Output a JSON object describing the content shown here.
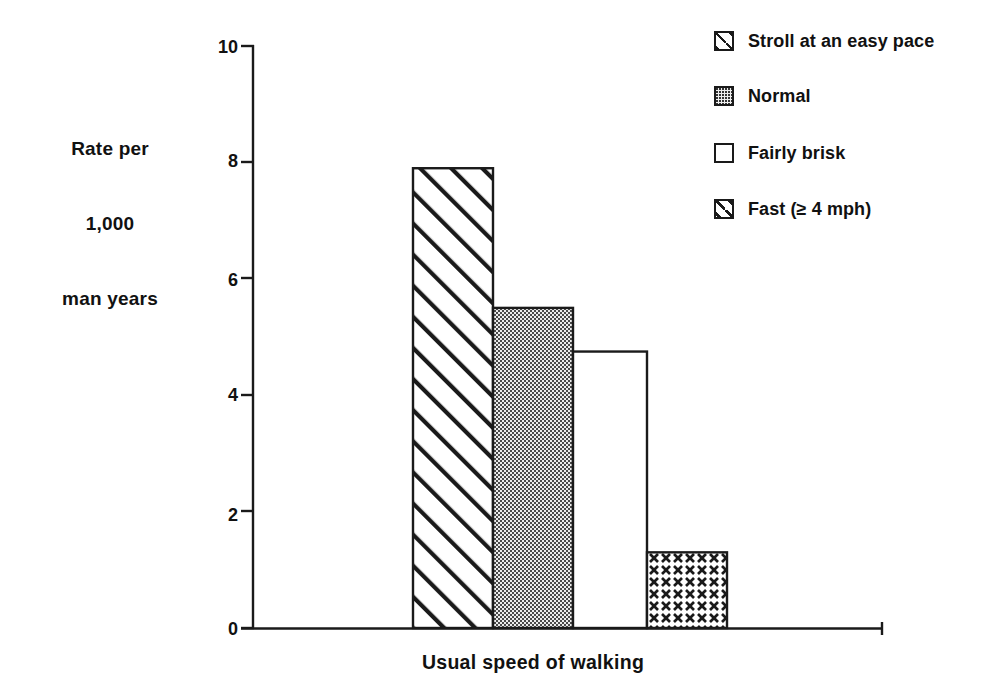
{
  "chart_data": {
    "type": "bar",
    "title": "",
    "subtitle": "",
    "xlabel": "Usual speed of walking",
    "ylabel": "Rate per\n1,000\nman years",
    "ylabel_lines": [
      "Rate per",
      "1,000",
      "man years"
    ],
    "categories": [
      "Stroll at an easy pace",
      "Normal",
      "Fairly brisk",
      "Fast (≥ 4 mph)"
    ],
    "values": [
      7.9,
      5.5,
      4.75,
      1.3
    ],
    "ylim": [
      0,
      10
    ],
    "yticks": [
      0,
      2,
      4,
      6,
      8,
      10
    ],
    "ytick_labels": [
      "0",
      "2",
      "4",
      "6",
      "8",
      "10"
    ],
    "xticks": [],
    "xtick_labels": [],
    "grid": false,
    "legend_position": "top-right",
    "bars_adjacent": true,
    "series": [
      {
        "name": "Rate per 1,000 man years",
        "values": [
          7.9,
          5.5,
          4.75,
          1.3
        ]
      }
    ],
    "bar_styles": [
      "diagonal-hatch",
      "stipple-dots",
      "empty-white",
      "cross-hatch"
    ]
  },
  "legend": {
    "items": [
      {
        "label": "Stroll at an easy pace",
        "swatch": "diagonal-hatch-swatch",
        "value": 7.9
      },
      {
        "label": "Normal",
        "swatch": "stipple-dots-swatch",
        "value": 5.5
      },
      {
        "label": "Fairly brisk",
        "swatch": "empty-white-swatch",
        "value": 4.75
      },
      {
        "label": "Fast (≥ 4 mph)",
        "swatch": "cross-hatch-swatch",
        "value": 1.3
      }
    ]
  },
  "axes": {
    "y_title_line1": "Rate per",
    "y_title_line2": "1,000",
    "y_title_line3": "man years",
    "x_title": "Usual speed of walking",
    "y_tick_0": "0",
    "y_tick_2": "2",
    "y_tick_4": "4",
    "y_tick_6": "6",
    "y_tick_8": "8",
    "y_tick_10": "10"
  },
  "colors": {
    "ink": "#1a1a1a",
    "background": "#ffffff",
    "hatch": "#1a1a1a",
    "stipple_fill": "#e8e8e8"
  }
}
